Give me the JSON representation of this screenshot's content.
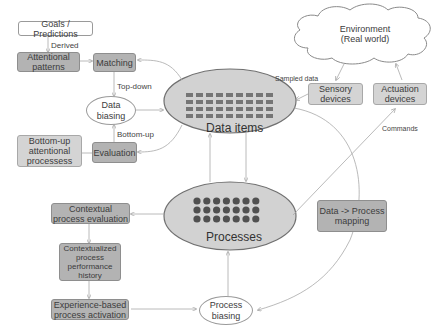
{
  "diagram": {
    "nodes": {
      "goals": "Goals / Predictions",
      "attentional_patterns": "Attentional patterns",
      "matching": "Matching",
      "data_biasing": "Data biasing",
      "evaluation": "Evaluation",
      "bottom_up_processes": "Bottom-up attentional processess",
      "data_items": "Data items",
      "processes": "Processes",
      "environment_line1": "Environment",
      "environment_line2": "(Real world)",
      "sensory_devices": "Sensory devices",
      "actuation_devices": "Actuation devices",
      "contextual_eval": "Contextual process evaluation",
      "contextualized_history": "Contextualized process performance history",
      "experience_activation": "Experience-based process activation",
      "process_biasing": "Process biasing",
      "data_process_mapping": "Data -> Process mapping"
    },
    "edge_labels": {
      "derived": "Derived",
      "top_down": "Top-down",
      "bottom_up": "Bottom-up",
      "sampled_data": "Sampled data",
      "commands": "Commands"
    },
    "data_items_grid": {
      "rows": 4,
      "cols": 9
    },
    "processes_grid": {
      "rows": 3,
      "cols": 7
    },
    "colors": {
      "ellipse_fill": "#d2d2d2",
      "ellipse_stroke": "#707070",
      "item_mark": "#757575",
      "line": "#a0a0a0"
    }
  }
}
